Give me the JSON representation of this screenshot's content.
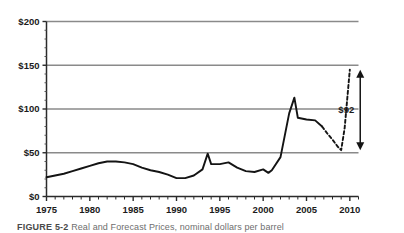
{
  "figure": {
    "caption_label": "FIGURE 5-2",
    "caption_body": "Real and Forecast Prices, nominal dollars per barrel"
  },
  "annotation": {
    "delta_label": "$92",
    "arrow_icon": "double-headed-vertical-arrow-icon"
  },
  "chart_data": {
    "type": "line",
    "title": "",
    "xlabel": "",
    "ylabel": "",
    "xlim": [
      1975,
      2011
    ],
    "ylim": [
      0,
      200
    ],
    "grid": "horizontal",
    "legend": "none",
    "y_ticks": [
      0,
      50,
      100,
      150,
      200
    ],
    "y_tick_labels": [
      "$0",
      "$50",
      "$100",
      "$150",
      "$200"
    ],
    "x_ticks": [
      1975,
      1980,
      1985,
      1990,
      1995,
      2000,
      2005,
      2010
    ],
    "x_tick_labels": [
      "1975",
      "1980",
      "1985",
      "1990",
      "1995",
      "2000",
      "2005",
      "2010"
    ],
    "x_minor_tick_step": 1,
    "series": [
      {
        "name": "historical",
        "style": "solid",
        "color": "#141414",
        "x": [
          1975,
          1976,
          1977,
          1978,
          1979,
          1980,
          1981,
          1982,
          1983,
          1984,
          1985,
          1986,
          1987,
          1988,
          1989,
          1990,
          1991,
          1992,
          1993,
          1993.6,
          1994,
          1995,
          1996,
          1997,
          1998,
          1999,
          2000,
          2000.6,
          2001,
          2002,
          2003,
          2003.6,
          2004,
          2005,
          2006,
          2006.8
        ],
        "y": [
          22,
          24,
          26,
          29,
          32,
          35,
          38,
          40,
          40,
          39,
          37,
          33,
          30,
          28,
          25,
          21,
          21,
          24,
          31,
          49,
          37,
          37,
          39,
          33,
          29,
          28,
          31,
          27,
          30,
          45,
          95,
          113,
          90,
          88,
          87,
          80
        ]
      },
      {
        "name": "forecast",
        "style": "dashed",
        "color": "#141414",
        "x": [
          2006.8,
          2007.4,
          2008,
          2008.6,
          2009,
          2009.4,
          2010
        ],
        "y": [
          80,
          72,
          65,
          57,
          53,
          78,
          145
        ]
      }
    ],
    "annotations": [
      {
        "text": "$92",
        "type": "range-arrow",
        "y_from": 53,
        "y_to": 145,
        "at_x": 2011.2
      }
    ]
  }
}
